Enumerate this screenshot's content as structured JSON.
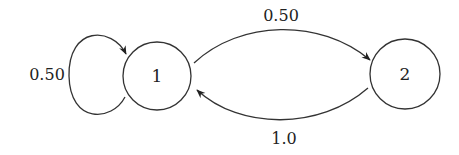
{
  "diagram": {
    "type": "state-transition-graph",
    "nodes": [
      {
        "id": "1",
        "label": "1"
      },
      {
        "id": "2",
        "label": "2"
      }
    ],
    "edges": [
      {
        "from": "1",
        "to": "1",
        "label": "0.50"
      },
      {
        "from": "1",
        "to": "2",
        "label": "0.50"
      },
      {
        "from": "2",
        "to": "1",
        "label": "1.0"
      }
    ],
    "colors": {
      "stroke": "#333333",
      "background": "#ffffff"
    }
  }
}
